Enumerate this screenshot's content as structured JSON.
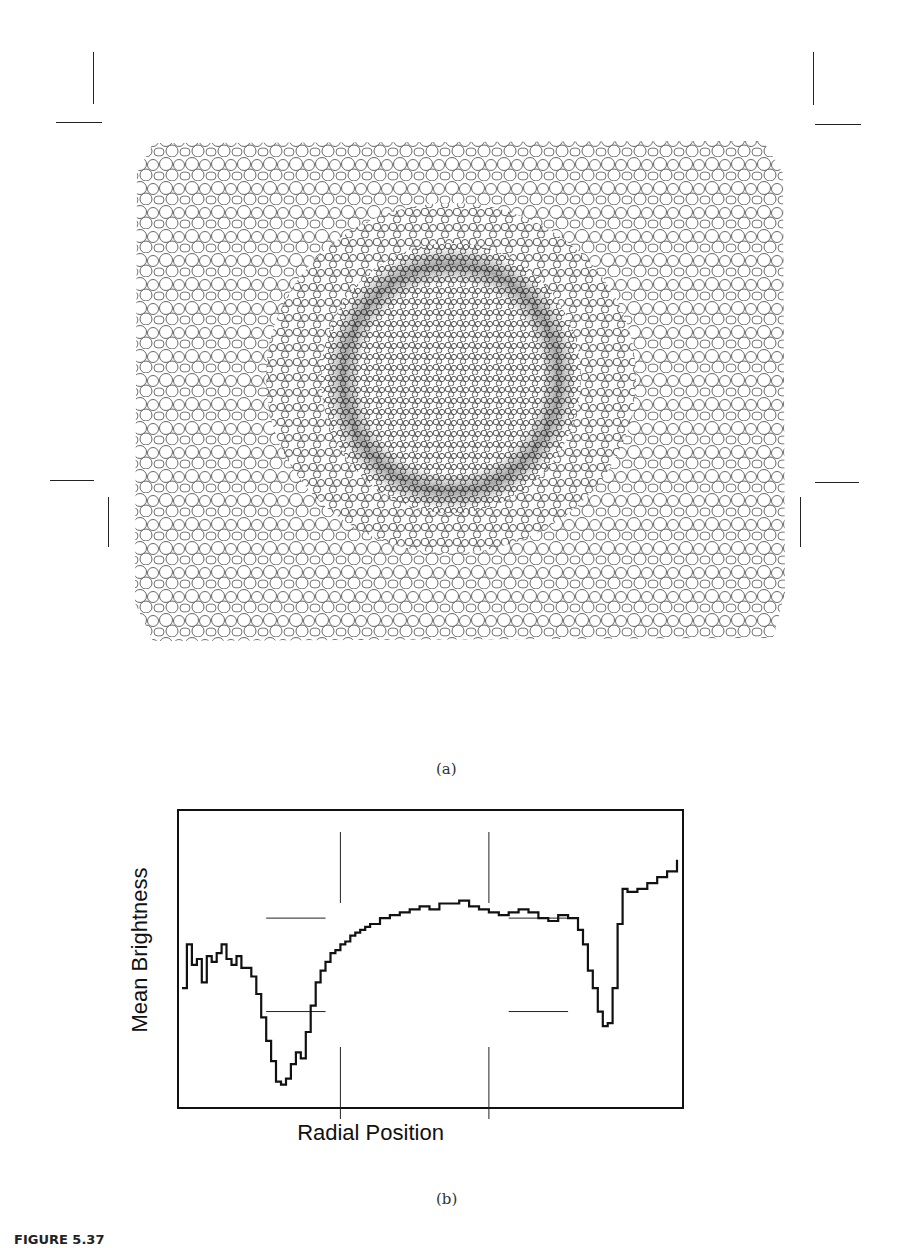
{
  "figure": {
    "panel_a_label": "(a)",
    "panel_b_label": "(b)",
    "caption_label": "FIGURE 5.37",
    "caption_text": "Cross section of lens-shaped radial plant tissue, with placement of measurement lines..."
  },
  "micrograph": {
    "description": "grayscale micrograph of plant stem cross section with central stele surrounded by large parenchyma cells",
    "crop_marks": "corner crop marks at four corners"
  },
  "chart_data": {
    "type": "line",
    "title": "",
    "xlabel": "Radial Position",
    "ylabel": "Mean Brightness",
    "grid": false,
    "legend": null,
    "x_ticks": [],
    "y_ticks": [],
    "xlim": [
      0,
      100
    ],
    "ylim": [
      0,
      100
    ],
    "series": [
      {
        "name": "mean brightness profile",
        "x": [
          0,
          1,
          2,
          3,
          4,
          5,
          6,
          7,
          8,
          9,
          10,
          11,
          12,
          13,
          14,
          15,
          16,
          17,
          18,
          19,
          20,
          21,
          22,
          23,
          24,
          25,
          26,
          27,
          28,
          29,
          30,
          31,
          32,
          33,
          34,
          35,
          36,
          37,
          38,
          40,
          42,
          44,
          46,
          48,
          50,
          52,
          54,
          56,
          58,
          60,
          62,
          64,
          66,
          68,
          70,
          72,
          74,
          76,
          78,
          80,
          81,
          82,
          83,
          84,
          85,
          86,
          87,
          88,
          89,
          90,
          92,
          94,
          96,
          98,
          100
        ],
        "values": [
          40,
          55,
          48,
          50,
          42,
          51,
          49,
          52,
          55,
          50,
          48,
          51,
          47,
          47,
          44,
          38,
          30,
          22,
          15,
          8,
          7,
          9,
          14,
          18,
          16,
          25,
          34,
          42,
          46,
          49,
          52,
          53,
          55,
          56,
          58,
          59,
          60,
          61,
          62,
          64,
          65,
          66,
          67,
          68,
          67,
          69,
          69,
          70,
          68,
          67,
          66,
          65,
          66,
          67,
          66,
          64,
          63,
          65,
          64,
          60,
          55,
          46,
          40,
          32,
          27,
          28,
          40,
          62,
          74,
          73,
          74,
          76,
          78,
          80,
          84
        ]
      }
    ],
    "annotations": [
      {
        "type": "guide-line",
        "orientation": "vertical",
        "x": 32,
        "region": "top"
      },
      {
        "type": "guide-line",
        "orientation": "vertical",
        "x": 62,
        "region": "top"
      },
      {
        "type": "guide-line",
        "orientation": "vertical",
        "x": 32,
        "region": "bottom"
      },
      {
        "type": "guide-line",
        "orientation": "vertical",
        "x": 62,
        "region": "bottom"
      },
      {
        "type": "guide-line",
        "orientation": "horizontal",
        "y": 64,
        "x_range": [
          17,
          29
        ]
      },
      {
        "type": "guide-line",
        "orientation": "horizontal",
        "y": 32,
        "x_range": [
          17,
          29
        ]
      },
      {
        "type": "guide-line",
        "orientation": "horizontal",
        "y": 64,
        "x_range": [
          66,
          78
        ]
      },
      {
        "type": "guide-line",
        "orientation": "horizontal",
        "y": 32,
        "x_range": [
          66,
          78
        ]
      }
    ]
  }
}
